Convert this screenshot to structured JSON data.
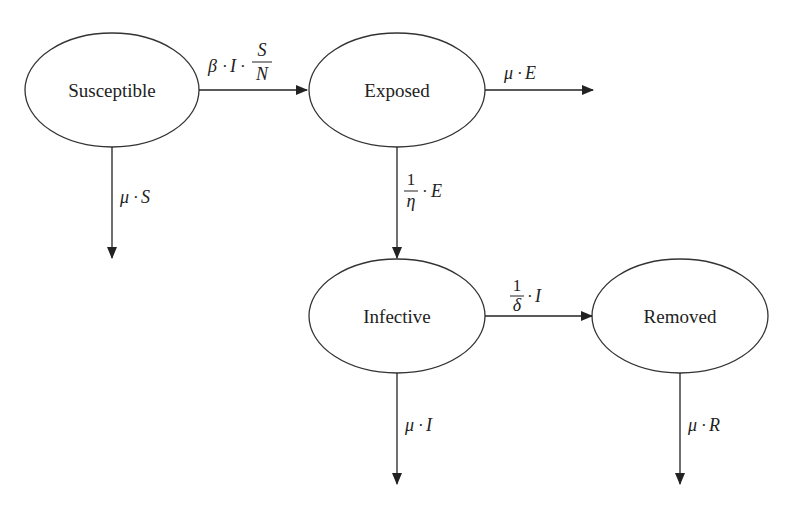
{
  "diagram": {
    "nodes": {
      "susceptible": {
        "label": "Susceptible"
      },
      "exposed": {
        "label": "Exposed"
      },
      "infective": {
        "label": "Infective"
      },
      "removed": {
        "label": "Removed"
      }
    },
    "edges": {
      "s_to_e": {
        "from": "Susceptible",
        "to": "Exposed",
        "beta": "β",
        "dot": "·",
        "I": "I",
        "frac_num": "S",
        "frac_den": "N"
      },
      "e_out": {
        "from": "Exposed",
        "to": "out",
        "mu": "μ",
        "dot": "·",
        "var": "E"
      },
      "s_out": {
        "from": "Susceptible",
        "to": "out",
        "mu": "μ",
        "dot": "·",
        "var": "S"
      },
      "e_to_i": {
        "from": "Exposed",
        "to": "Infective",
        "frac_num": "1",
        "frac_den": "η",
        "dot": "·",
        "var": "E"
      },
      "i_to_r": {
        "from": "Infective",
        "to": "Removed",
        "frac_num": "1",
        "frac_den": "δ",
        "dot": "·",
        "var": "I"
      },
      "i_out": {
        "from": "Infective",
        "to": "out",
        "mu": "μ",
        "dot": "·",
        "var": "I"
      },
      "r_out": {
        "from": "Removed",
        "to": "out",
        "mu": "μ",
        "dot": "·",
        "var": "R"
      }
    },
    "caption": {
      "text": "",
      "truncated": true
    }
  }
}
